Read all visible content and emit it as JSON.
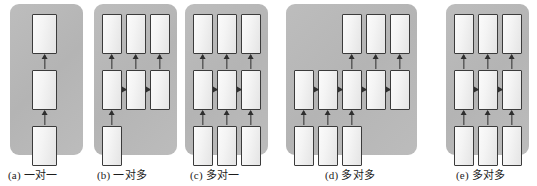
{
  "figure": {
    "background_color": "#ffffff",
    "panel_color": "#b9b9b9",
    "cell_fill_color": "#f2f2f2",
    "cell_border_color": "#3b3b3b",
    "arrow_color": "#2e2e2e"
  },
  "panels": [
    {
      "id": "a",
      "caption": "(a) 一对一",
      "caption_label": "(a)",
      "caption_text": "一对一",
      "input_count": 1,
      "hidden_count": 1,
      "output_count": 1,
      "recurrent_arrows": 0,
      "vertical_arrows": 2
    },
    {
      "id": "b",
      "caption": "(b) 一对多",
      "caption_label": "(b)",
      "caption_text": "一对多",
      "input_count": 1,
      "hidden_count": 3,
      "output_count": 3,
      "recurrent_arrows": 2,
      "vertical_arrows": 4
    },
    {
      "id": "c",
      "caption": "(c) 多对一",
      "caption_label": "(c)",
      "caption_text": "多对一",
      "input_count": 3,
      "hidden_count": 3,
      "output_count": 3,
      "recurrent_arrows": 2,
      "vertical_arrows": 6
    },
    {
      "id": "d",
      "caption": "(d) 多对多",
      "caption_label": "(d)",
      "caption_text": "多对多",
      "input_count": 3,
      "hidden_count": 5,
      "output_count": 3,
      "recurrent_arrows": 4,
      "vertical_arrows": 6
    },
    {
      "id": "e",
      "caption": "(e) 多对多",
      "caption_label": "(e)",
      "caption_text": "多对多",
      "input_count": 3,
      "hidden_count": 3,
      "output_count": 3,
      "recurrent_arrows": 2,
      "vertical_arrows": 6
    }
  ],
  "captions": {
    "a": "(a) 一对一",
    "b": "(b) 一对多",
    "c": "(c) 多对一",
    "d": "(d) 多对多",
    "e": "(e) 多对多"
  }
}
